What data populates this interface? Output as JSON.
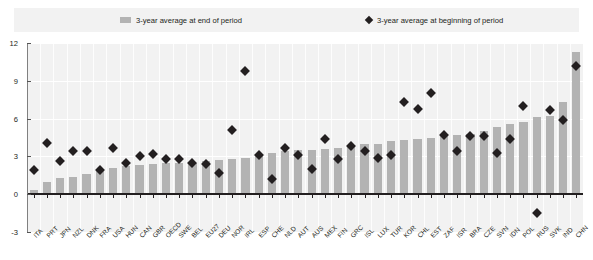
{
  "legend": {
    "bar_label": "3-year average at end of period",
    "diamond_label": "3-year average at beginning of period",
    "bar_icon": "legend-bar-swatch",
    "diamond_icon": "legend-diamond-swatch"
  },
  "axes": {
    "y_ticks": [
      "12",
      "9",
      "6",
      "3",
      "0",
      "-3"
    ],
    "ylim": [
      -3,
      12
    ],
    "ylabel": "",
    "xlabel": ""
  },
  "colors": {
    "bar": "#b3b3b3",
    "diamond": "#231f20",
    "plot_background": "#f2f2f2",
    "gridline": "#ffffff",
    "zeroline": "#231f20",
    "axis": "#808080"
  },
  "chart_data": {
    "type": "bar",
    "title": "",
    "subtitle": "",
    "xlabel": "",
    "ylabel": "",
    "ylim": [
      -3,
      12
    ],
    "grid": true,
    "legend_position": "top",
    "categories": [
      "ITA",
      "PRT",
      "JPN",
      "NZL",
      "DNK",
      "FRA",
      "USA",
      "HUN",
      "CAN",
      "GBR",
      "OECD",
      "SWE",
      "BEL",
      "EU27",
      "DEU",
      "NOR",
      "IRL",
      "ESP",
      "CHE",
      "NLD",
      "AUT",
      "AUS",
      "MEX",
      "FIN",
      "GRC",
      "ISL",
      "LUX",
      "TUR",
      "KOR",
      "CHL",
      "EST",
      "ZAF",
      "ISR",
      "BRA",
      "CZE",
      "SVN",
      "IDN",
      "POL",
      "RUS",
      "SVK",
      "IND",
      "CHN"
    ],
    "series": [
      {
        "name": "3-year average at end of period",
        "type": "bar",
        "values": [
          0.3,
          1.0,
          1.3,
          1.4,
          1.6,
          1.9,
          2.1,
          2.2,
          2.3,
          2.4,
          2.5,
          2.5,
          2.5,
          2.6,
          2.7,
          2.8,
          2.9,
          3.1,
          3.3,
          3.4,
          3.5,
          3.5,
          3.6,
          3.7,
          3.8,
          4.0,
          4.0,
          4.2,
          4.3,
          4.4,
          4.5,
          4.6,
          4.7,
          4.8,
          5.0,
          5.3,
          5.6,
          5.7,
          6.1,
          6.2,
          7.3,
          11.3
        ]
      },
      {
        "name": "3-year average at beginning of period",
        "type": "scatter",
        "marker": "diamond",
        "values": [
          1.9,
          4.1,
          2.6,
          3.4,
          3.4,
          1.9,
          3.7,
          2.5,
          3.0,
          3.2,
          2.8,
          2.8,
          2.5,
          2.4,
          1.7,
          5.1,
          9.8,
          3.1,
          1.2,
          3.7,
          3.1,
          2.0,
          4.4,
          2.8,
          3.8,
          3.4,
          2.9,
          3.1,
          7.3,
          6.8,
          8.0,
          4.7,
          3.4,
          4.6,
          4.6,
          3.3,
          4.4,
          7.0,
          -1.5,
          6.7,
          5.9,
          10.2
        ]
      }
    ]
  }
}
